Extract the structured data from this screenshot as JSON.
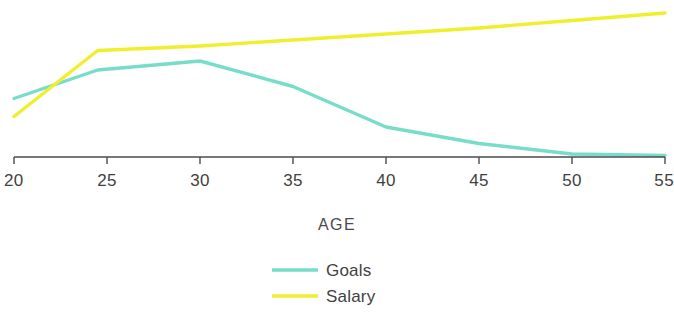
{
  "chart_data": {
    "type": "line",
    "title": "",
    "xlabel": "AGE",
    "ylabel": "",
    "x": [
      20,
      25,
      30,
      35,
      40,
      45,
      50,
      55
    ],
    "xticks": [
      "20",
      "25",
      "30",
      "35",
      "40",
      "45",
      "50",
      "55"
    ],
    "xlim": [
      20,
      55
    ],
    "ylim": [
      0,
      100
    ],
    "grid": false,
    "legend_position": "bottom-center",
    "series": [
      {
        "name": "Goals",
        "color": "#77ddc9",
        "values": [
          39,
          58,
          64,
          47,
          20,
          9,
          2,
          1
        ],
        "x": [
          20,
          24.5,
          30,
          35,
          40,
          45,
          50,
          55
        ]
      },
      {
        "name": "Salary",
        "color": "#f0ef2e",
        "values": [
          27,
          71,
          74,
          78,
          82,
          86,
          91,
          96
        ],
        "x": [
          20,
          24.5,
          30,
          35,
          40,
          45,
          50,
          55
        ]
      }
    ]
  },
  "axis": {
    "x_title": "AGE",
    "tick_labels": [
      "20",
      "25",
      "30",
      "35",
      "40",
      "45",
      "50",
      "55"
    ],
    "line_color": "#4b4b4b"
  },
  "legend": {
    "items": [
      {
        "label": "Goals",
        "color": "#77ddc9"
      },
      {
        "label": "Salary",
        "color": "#f0ef2e"
      }
    ]
  }
}
